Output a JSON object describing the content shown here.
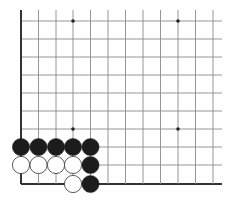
{
  "board": {
    "description": "Go board corner (lower-left) diagram",
    "colors": {
      "background": "#ffffff",
      "grid": "#8a8a8a",
      "edge": "#333333",
      "black_stone": "#1c1c1c",
      "white_stone": "#ffffff",
      "white_stone_outline": "#333333",
      "star_point": "#222222"
    },
    "grid": {
      "x_lines": [
        21,
        38.5,
        56,
        73,
        90.5,
        108,
        125.5,
        143,
        160.5,
        178,
        195.5,
        213
      ],
      "y_lines": [
        21,
        39,
        57,
        75,
        93,
        111,
        129,
        147,
        165,
        184
      ],
      "right_extent": 222,
      "top_extent": 10
    },
    "edges": [
      "left",
      "bottom"
    ],
    "star_points": [
      {
        "col": 3,
        "row": 0
      },
      {
        "col": 9,
        "row": 0
      },
      {
        "col": 3,
        "row": 6
      },
      {
        "col": 9,
        "row": 6
      }
    ],
    "stones": [
      {
        "color": "black",
        "col": 0,
        "row": 7
      },
      {
        "color": "black",
        "col": 1,
        "row": 7
      },
      {
        "color": "black",
        "col": 2,
        "row": 7
      },
      {
        "color": "black",
        "col": 3,
        "row": 7
      },
      {
        "color": "black",
        "col": 4,
        "row": 7
      },
      {
        "color": "white",
        "col": 0,
        "row": 8
      },
      {
        "color": "white",
        "col": 1,
        "row": 8
      },
      {
        "color": "white",
        "col": 2,
        "row": 8
      },
      {
        "color": "white",
        "col": 3,
        "row": 8
      },
      {
        "color": "black",
        "col": 4,
        "row": 8
      },
      {
        "color": "white",
        "col": 3,
        "row": 9
      },
      {
        "color": "black",
        "col": 4,
        "row": 9
      }
    ],
    "stone_radius": 8.6
  }
}
